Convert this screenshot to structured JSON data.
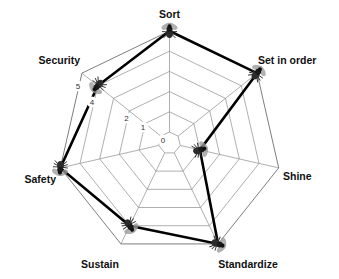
{
  "chart_data": {
    "type": "radar",
    "title": "",
    "subtitle": "",
    "xlabel": "",
    "ylabel": "",
    "categories": [
      "Sort",
      "Set in order",
      "Shine",
      "Standardize",
      "Sustain",
      "Safety",
      "Security"
    ],
    "values": [
      5,
      5,
      1,
      5,
      4,
      5,
      4
    ],
    "series": [
      {
        "name": "Assessment",
        "values": [
          5,
          5,
          1,
          5,
          4,
          5,
          4
        ]
      }
    ],
    "rlim": [
      0,
      5
    ],
    "tick_labels": [
      "0",
      "1",
      "2",
      "3",
      "4",
      "5"
    ],
    "tick_values": [
      0,
      1,
      2,
      3,
      4,
      5
    ],
    "visible_tick_labels": [
      "0",
      "1",
      "2",
      "4",
      "5"
    ],
    "hidden_tick_labels": [
      "3"
    ],
    "tick_axis": "Security",
    "grid": true,
    "legend": false,
    "legend_position": "none",
    "marker": "fly-icon",
    "marker_note": "Each data point is rendered as a small fly/insect image",
    "colors": {
      "background": "#ffffff",
      "grid": "#8c8c8c",
      "data_line": "#000000",
      "label_text": "#111111",
      "tick_text": "#333333",
      "marker_body": "#2b2b2b",
      "marker_wing": "#9a9a9a"
    }
  },
  "axes": [
    {
      "label": "Sort",
      "value": 5,
      "angle_deg": -90,
      "label_anchor": "middle",
      "label_x": 169.5,
      "label_y": 18
    },
    {
      "label": "Set in order",
      "value": 5,
      "angle_deg": -38.571,
      "label_anchor": "start",
      "label_x": 258,
      "label_y": 64
    },
    {
      "label": "Shine",
      "value": 1,
      "angle_deg": 12.857,
      "label_anchor": "start",
      "label_x": 283,
      "label_y": 180
    },
    {
      "label": "Standardize",
      "value": 5,
      "angle_deg": 64.286,
      "label_anchor": "middle",
      "label_x": 248,
      "label_y": 268
    },
    {
      "label": "Sustain",
      "value": 4,
      "angle_deg": 115.714,
      "label_anchor": "middle",
      "label_x": 100,
      "label_y": 268
    },
    {
      "label": "Safety",
      "value": 5,
      "angle_deg": 167.143,
      "label_anchor": "end",
      "label_x": 56,
      "label_y": 183
    },
    {
      "label": "Security",
      "value": 4,
      "angle_deg": -141.43,
      "label_anchor": "end",
      "label_x": 80,
      "label_y": 64
    }
  ],
  "ticks": [
    {
      "label": "5",
      "value": 5,
      "x": 78,
      "y": 89
    },
    {
      "label": "4",
      "value": 4,
      "x": 92,
      "y": 105
    },
    {
      "label": "2",
      "value": 2,
      "x": 126.5,
      "y": 121
    },
    {
      "label": "1",
      "value": 1,
      "x": 143,
      "y": 130
    },
    {
      "label": "0",
      "value": 0,
      "x": 163,
      "y": 143
    }
  ]
}
